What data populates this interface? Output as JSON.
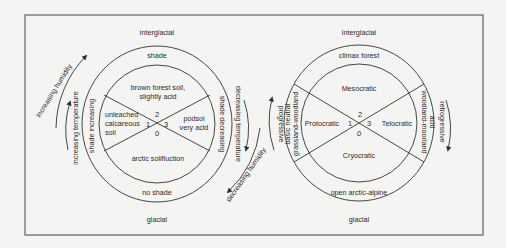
{
  "left_diagram": {
    "top_label": "interglacial",
    "bottom_label": "glacial",
    "outer_ring": {
      "top": "shade",
      "bottom": "no shade",
      "left": "shade increasing",
      "right": "shade decreasing"
    },
    "sectors": {
      "top": [
        "brown forest soil,",
        "slightly acid"
      ],
      "left": [
        "unleached",
        "calcareous",
        "soil"
      ],
      "right": [
        "podsol",
        "very acid"
      ],
      "bottom": [
        "arctic solifluction"
      ]
    },
    "numbers": {
      "top": "2",
      "left": "1",
      "right": "3",
      "bottom": "0"
    },
    "arrows": {
      "outer_left": "increasing humidity",
      "inner_left": "increasing temperature",
      "inner_right": "decreasing temperature",
      "outer_right": "decreasing humidity"
    }
  },
  "right_diagram": {
    "top_label": "interglacial",
    "bottom_label": "glacial",
    "outer_ring": {
      "top": "climax forest",
      "bottom": "open arctic-alpine",
      "left": [
        "basic  neutral",
        "grassland-woodland"
      ],
      "right": [
        "woodland-moorland",
        "acid"
      ]
    },
    "sectors": {
      "top": "Mesocratic",
      "left": "Protocratic",
      "right": "Telocratic",
      "bottom": "Cryocratic"
    },
    "numbers": {
      "top": "2",
      "left": "1",
      "right": "3",
      "bottom": "0"
    },
    "arrows": {
      "left": "progressive",
      "right": "retrogressive"
    }
  },
  "colors": {
    "ink": "#2a2a2a",
    "background": "#f4f4f2"
  }
}
